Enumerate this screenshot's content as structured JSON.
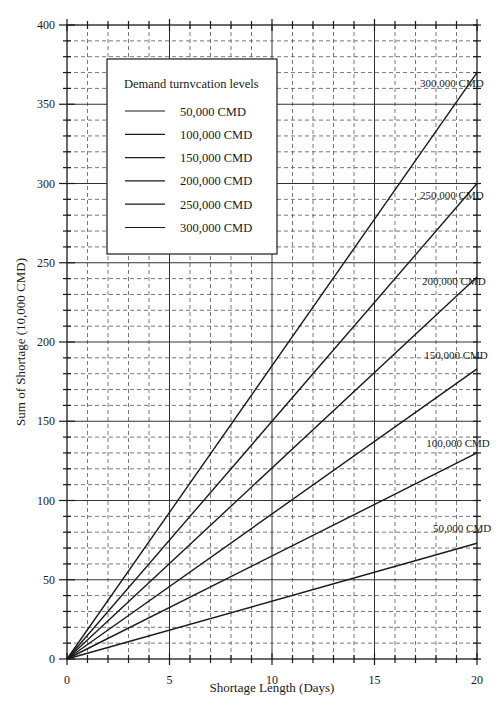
{
  "chart_data": {
    "type": "line",
    "title": "",
    "xlabel": "Shortage Length (Days)",
    "ylabel": "Sum of Shortage (10,000 CMD)",
    "xlim": [
      0,
      20
    ],
    "ylim": [
      0,
      400
    ],
    "x_ticks": [
      0,
      5,
      10,
      15,
      20
    ],
    "y_ticks": [
      0,
      50,
      100,
      150,
      200,
      250,
      300,
      350,
      400
    ],
    "x_minor_step": 1,
    "y_minor_step": 10,
    "grid": {
      "major": "solid",
      "minor": "dashed"
    },
    "legend": {
      "title": "Demand turnvcation levels",
      "position": "upper-left-inset",
      "entries": [
        "50,000 CMD",
        "100,000 CMD",
        "150,000 CMD",
        "200,000 CMD",
        "250,000 CMD",
        "300,000 CMD"
      ]
    },
    "x": [
      0,
      20
    ],
    "series": [
      {
        "name": "50,000 CMD",
        "values": [
          0,
          73
        ],
        "label": "50,000 CMD"
      },
      {
        "name": "100,000 CMD",
        "values": [
          0,
          130
        ],
        "label": "100,000 CMD"
      },
      {
        "name": "150,000 CMD",
        "values": [
          0,
          183
        ],
        "label": "150,000 CMD"
      },
      {
        "name": "200,000 CMD",
        "values": [
          0,
          241
        ],
        "label": "200,000 CMD"
      },
      {
        "name": "250,000 CMD",
        "values": [
          0,
          300
        ],
        "label": "250,000 CMD"
      },
      {
        "name": "300,000 CMD",
        "values": [
          0,
          370
        ],
        "label": "300,000 CMD"
      }
    ],
    "series_label_positions": [
      {
        "x": 18.2,
        "y": 80
      },
      {
        "x": 18.0,
        "y": 134
      },
      {
        "x": 17.9,
        "y": 189
      },
      {
        "x": 17.8,
        "y": 236
      },
      {
        "x": 17.7,
        "y": 290
      },
      {
        "x": 17.7,
        "y": 361
      }
    ],
    "colors": {
      "line": "#1a1a1a",
      "grid": "#555555",
      "background": "#ffffff"
    }
  }
}
